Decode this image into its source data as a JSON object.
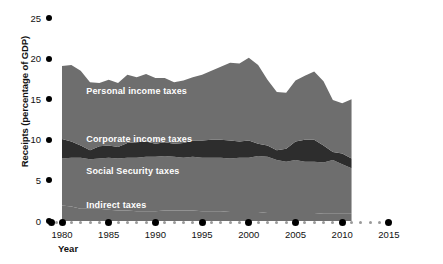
{
  "chart_data": {
    "type": "area",
    "stacked": true,
    "title": "",
    "xlabel": "Year",
    "ylabel": "Receipts (percentage of GDP)",
    "xlim": [
      1979,
      2016
    ],
    "ylim": [
      0,
      26.5
    ],
    "x_ticks": [
      1980,
      1985,
      1990,
      1995,
      2000,
      2005,
      2010,
      2015
    ],
    "x_tick_labels": [
      "1980",
      "1985",
      "1990",
      "1995",
      "2000",
      "2005",
      "2010",
      "2015"
    ],
    "x_minor_per_interval": 4,
    "y_ticks": [
      0,
      5,
      10,
      15,
      20,
      25
    ],
    "y_tick_labels": [
      "0",
      "5",
      "10",
      "15",
      "20",
      "25"
    ],
    "grid": false,
    "legend": "inline-area-labels",
    "x": [
      1980,
      1981,
      1982,
      1983,
      1984,
      1985,
      1986,
      1987,
      1988,
      1989,
      1990,
      1991,
      1992,
      1993,
      1994,
      1995,
      1996,
      1997,
      1998,
      1999,
      2000,
      2001,
      2002,
      2003,
      2004,
      2005,
      2006,
      2007,
      2008,
      2009,
      2010,
      2011
    ],
    "series": [
      {
        "name": "Indirect taxes",
        "color": "#6e6e6e",
        "values": [
          1.9,
          1.8,
          1.5,
          1.5,
          1.5,
          1.4,
          1.3,
          1.3,
          1.2,
          1.2,
          1.2,
          1.3,
          1.3,
          1.3,
          1.3,
          1.2,
          1.2,
          1.2,
          1.1,
          1.1,
          1.1,
          1.1,
          1.0,
          1.0,
          1.0,
          1.0,
          1.0,
          1.0,
          0.9,
          0.9,
          0.9,
          0.9
        ]
      },
      {
        "name": "Social Security taxes",
        "color": "#6e6e6e",
        "values": [
          5.8,
          6.0,
          6.3,
          6.1,
          6.2,
          6.4,
          6.4,
          6.5,
          6.6,
          6.7,
          6.7,
          6.7,
          6.6,
          6.5,
          6.6,
          6.6,
          6.6,
          6.6,
          6.6,
          6.7,
          6.7,
          6.9,
          6.9,
          6.5,
          6.3,
          6.5,
          6.3,
          6.3,
          6.3,
          6.6,
          6.1,
          5.6
        ]
      },
      {
        "name": "Corporate income taxes",
        "color": "#2d2d2d",
        "values": [
          2.4,
          2.0,
          1.5,
          1.1,
          1.5,
          1.5,
          1.4,
          1.8,
          1.9,
          1.9,
          1.6,
          1.7,
          1.6,
          1.8,
          2.0,
          2.1,
          2.2,
          2.2,
          2.2,
          2.0,
          2.1,
          1.5,
          1.4,
          1.2,
          1.6,
          2.3,
          2.7,
          2.7,
          2.1,
          1.0,
          1.3,
          1.2
        ]
      },
      {
        "name": "Personal income taxes",
        "color": "#6e6e6e",
        "values": [
          9.0,
          9.4,
          9.2,
          8.4,
          7.8,
          8.1,
          7.9,
          8.4,
          8.0,
          8.3,
          8.1,
          7.9,
          7.6,
          7.7,
          7.8,
          8.1,
          8.5,
          9.0,
          9.6,
          9.6,
          10.2,
          9.7,
          8.1,
          7.2,
          6.9,
          7.5,
          7.9,
          8.4,
          7.9,
          6.4,
          6.2,
          7.3
        ]
      }
    ],
    "total_top": [
      19.1,
      19.2,
      18.5,
      17.1,
      17.0,
      17.4,
      17.0,
      18.0,
      17.7,
      18.1,
      17.6,
      17.6,
      17.1,
      17.3,
      17.7,
      18.0,
      18.5,
      19.0,
      19.5,
      19.4,
      20.1,
      19.2,
      17.4,
      15.9,
      15.8,
      17.3,
      17.9,
      18.4,
      17.2,
      14.9,
      14.5,
      15.0
    ],
    "annotations": [
      {
        "text": "Personal income taxes",
        "x": 1982.6,
        "y": 15.9
      },
      {
        "text": "Corporate income taxes",
        "x": 1982.6,
        "y": 10.0
      },
      {
        "text": "Social Security taxes",
        "x": 1982.6,
        "y": 6.1
      },
      {
        "text": "Indirect taxes",
        "x": 1982.6,
        "y": 1.8
      }
    ]
  },
  "colors": {
    "light_gray_area": "#6e6e6e",
    "dark_gray_area": "#2d2d2d",
    "axis_dot": "#000000",
    "minor_dot": "#9a9a9a",
    "text": "#111111",
    "label_text": "#ffffff",
    "background": "#ffffff"
  }
}
